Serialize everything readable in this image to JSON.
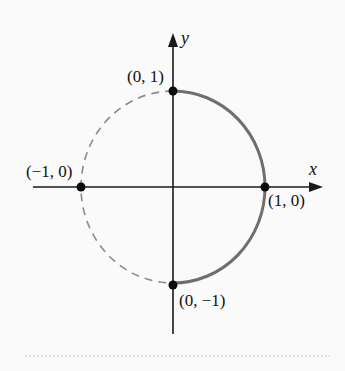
{
  "figure": {
    "axes": {
      "x_label": "x",
      "y_label": "y"
    },
    "points": [
      {
        "name": "top",
        "label": "(0, 1)",
        "x": 0,
        "y": 1
      },
      {
        "name": "left",
        "label": "(−1, 0)",
        "x": -1,
        "y": 0
      },
      {
        "name": "right",
        "label": "(1, 0)",
        "x": 1,
        "y": 0
      },
      {
        "name": "bottom",
        "label": "(0, −1)",
        "x": 0,
        "y": -1
      }
    ],
    "curves": [
      {
        "name": "right-semicircle",
        "style": "solid",
        "from": "(0, -1)",
        "to": "(0, 1)",
        "color": "#6e6e6e"
      },
      {
        "name": "left-semicircle",
        "style": "dashed",
        "from": "(0, 1)",
        "to": "(0, -1)",
        "color": "#8a8a8a"
      }
    ],
    "colors": {
      "axis": "#1a1a1a",
      "solid_arc": "#6e6e6e",
      "dashed_arc": "#8a8a8a",
      "point": "#0a0a0a",
      "separator": "#c8c8c8",
      "background": "#fafafa"
    }
  }
}
